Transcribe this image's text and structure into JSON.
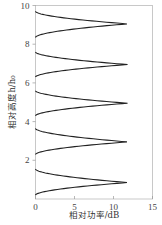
{
  "chart_data": {
    "type": "line",
    "title": "",
    "xlabel": "相对功率/dB",
    "ylabel": "相对高度h/h₀",
    "xlim": [
      0,
      15
    ],
    "ylim": [
      0,
      10
    ],
    "xticks": [
      0,
      5,
      10,
      15
    ],
    "yticks": [
      2,
      4,
      6,
      8,
      10
    ],
    "grid": false,
    "legend": null,
    "line_color": "#222222",
    "series": [
      {
        "name": "lobe-1",
        "y_start": 0.2,
        "y_end": 1.55,
        "peak_y": 0.85,
        "peak_x": 11.8
      },
      {
        "name": "lobe-2",
        "y_start": 2.3,
        "y_end": 3.65,
        "peak_y": 2.95,
        "peak_x": 11.8
      },
      {
        "name": "lobe-3",
        "y_start": 4.3,
        "y_end": 5.6,
        "peak_y": 4.95,
        "peak_x": 11.8
      },
      {
        "name": "lobe-4",
        "y_start": 6.3,
        "y_end": 7.6,
        "peak_y": 6.95,
        "peak_x": 11.8
      },
      {
        "name": "lobe-5",
        "y_start": 8.35,
        "y_end": 9.7,
        "peak_y": 9.05,
        "peak_x": 11.8
      }
    ]
  },
  "axes": {
    "x_title": "相对功率/dB",
    "y_title": "相对高度h/h₀",
    "x_tick_labels": [
      "0",
      "5",
      "10",
      "15"
    ],
    "y_tick_labels": [
      "2",
      "4",
      "6",
      "8",
      "10"
    ]
  }
}
